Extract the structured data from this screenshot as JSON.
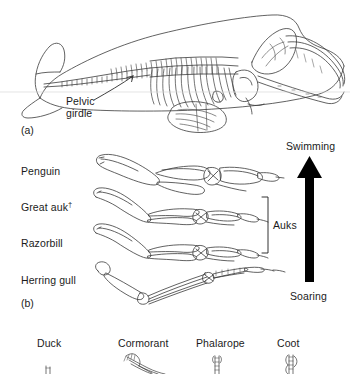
{
  "figure": {
    "panels": [
      {
        "tag": "(a)",
        "subject": "bowhead-whale-skeleton",
        "annotations": [
          {
            "name": "pelvic-girdle",
            "line1": "Pelvic",
            "line2": "girdle"
          }
        ]
      },
      {
        "tag": "(b)",
        "subject": "bird-wing-skeletons",
        "rows": [
          {
            "label": "Penguin",
            "extinct": false
          },
          {
            "label": "Great auk",
            "extinct": true,
            "dagger": "†"
          },
          {
            "label": "Razorbill",
            "extinct": false
          },
          {
            "label": "Herring gull",
            "extinct": false
          }
        ],
        "bracket": {
          "label": "Auks",
          "covers": [
            "Great auk",
            "Razorbill"
          ]
        },
        "gradient_arrow": {
          "top_label": "Swimming",
          "bottom_label": "Soaring",
          "direction": "up",
          "color": "#000000"
        }
      },
      {
        "tag": "",
        "subject": "bird-foot-types",
        "items": [
          {
            "label": "Duck"
          },
          {
            "label": "Cormorant"
          },
          {
            "label": "Phalarope"
          },
          {
            "label": "Coot"
          }
        ]
      }
    ],
    "colors": {
      "ink": "#1b1b1b",
      "line": "#3a3a3a",
      "arrow": "#000000",
      "background": "#ffffff"
    }
  }
}
